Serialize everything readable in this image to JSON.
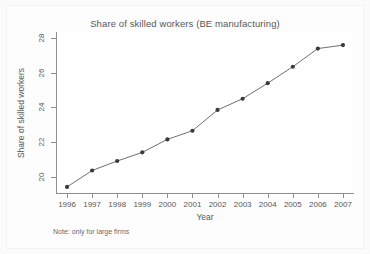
{
  "chart_data": {
    "type": "line",
    "title": "Share of skilled workers (BE manufacturing)",
    "xlabel": "Year",
    "ylabel": "Share of skilled workers",
    "note": "Note: only for large firms",
    "categories": [
      1996,
      1997,
      1998,
      1999,
      2000,
      2001,
      2002,
      2003,
      2004,
      2005,
      2006,
      2007
    ],
    "x_tick_labels": [
      "1996",
      "1997",
      "1998",
      "1999",
      "2000",
      "2001",
      "2002",
      "2003",
      "2004",
      "2005",
      "2006",
      "2007"
    ],
    "y_tick_labels": [
      "20",
      "22",
      "24",
      "26",
      "28"
    ],
    "y_ticks": [
      20,
      22,
      24,
      26,
      28
    ],
    "values": [
      19.4,
      20.35,
      20.9,
      21.4,
      22.15,
      22.65,
      23.85,
      24.5,
      25.4,
      26.35,
      27.4,
      27.6
    ],
    "series": [
      {
        "name": "Share of skilled workers",
        "values": [
          19.4,
          20.35,
          20.9,
          21.4,
          22.15,
          22.65,
          23.85,
          24.5,
          25.4,
          26.35,
          27.4,
          27.6
        ]
      }
    ],
    "xlim": [
      1995.6,
      2007.4
    ],
    "ylim": [
      19.05,
      28.3
    ],
    "grid": false,
    "legend": false,
    "marker": "filled-circle",
    "line_color": "#6f6f72",
    "marker_color": "#3a3a3c",
    "axis_color": "#8e8e90",
    "text_color": "#58585a",
    "plot_background": "#ffffff",
    "figure_background": "#fdfdfd"
  }
}
